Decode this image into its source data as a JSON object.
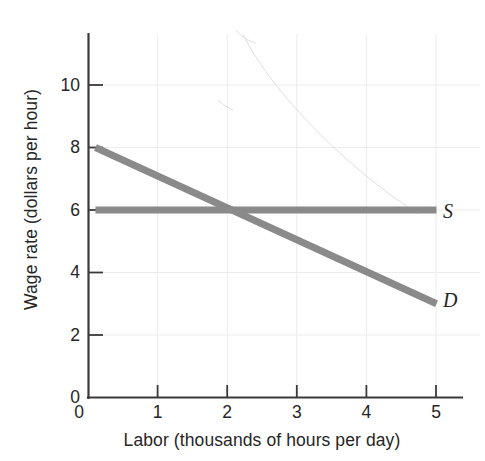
{
  "chart_data": {
    "type": "line",
    "title": "",
    "xlabel": "Labor (thousands of hours per day)",
    "ylabel": "Wage rate (dollars per hour)",
    "xlim": [
      0,
      5
    ],
    "ylim": [
      0,
      11
    ],
    "xticks": [
      0,
      1,
      2,
      3,
      4,
      5
    ],
    "yticks": [
      0,
      2,
      4,
      6,
      8,
      10
    ],
    "xtick_labels": [
      "0",
      "1",
      "2",
      "3",
      "4",
      "5"
    ],
    "ytick_labels": [
      "0",
      "2",
      "4",
      "6",
      "8",
      "10"
    ],
    "grid": true,
    "legend_position": "right-end-of-line",
    "series": [
      {
        "name": "S",
        "label": "S",
        "description": "Supply of labor (perfectly elastic at wage 6)",
        "color": "#8a8a8a",
        "x": [
          0.1,
          5.0
        ],
        "y": [
          6.0,
          6.0
        ]
      },
      {
        "name": "D",
        "label": "D",
        "description": "Demand for labor (downward sloping)",
        "color": "#8a8a8a",
        "x": [
          0.1,
          5.0
        ],
        "y": [
          8.0,
          3.0
        ]
      }
    ],
    "annotations": [
      {
        "name": "equilibrium",
        "x": 2.0,
        "y": 6.0,
        "text": ""
      }
    ]
  },
  "style": {
    "line_color": "#8a8a8a",
    "axis_color": "#3a3a3a",
    "grid_color": "#ededed",
    "text_color": "#262626",
    "background": "#ffffff",
    "line_width": 7
  }
}
